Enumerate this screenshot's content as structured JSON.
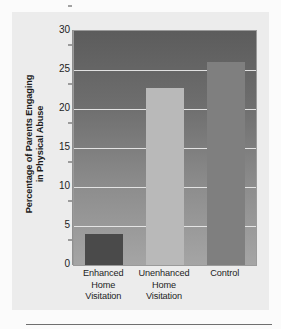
{
  "chart_data": {
    "type": "bar",
    "title": "",
    "subtitle": "",
    "xlabel": "",
    "ylabel": "Percentage of Parents Engaging in Physical Abuse",
    "ylabel_lines": [
      "Percentage of Parents Engaging",
      "in Physical Abuse"
    ],
    "categories": [
      "Enhanced Home Visitation",
      "Unenhanced Home Visitation",
      "Control"
    ],
    "category_lines": [
      [
        "Enhanced",
        "Home",
        "Visitation"
      ],
      [
        "Unenhanced",
        "Home",
        "Visitation"
      ],
      [
        "Control"
      ]
    ],
    "values": [
      4,
      22.7,
      26
    ],
    "ylim": [
      0,
      30
    ],
    "yticks": [
      0,
      5,
      10,
      15,
      20,
      25,
      30
    ],
    "ytick_labels": [
      "0",
      "5",
      "10",
      "15",
      "20",
      "25",
      "30"
    ],
    "grid": true,
    "grid_axis": "y",
    "legend": "none",
    "bar_colors": [
      "#4a4a4a",
      "#b9b9b9",
      "#7f7f7f"
    ],
    "plot_bg_top": "#5c5c5c",
    "plot_bg_bottom": "#a5a5a5",
    "panel_bg": "#ececec",
    "gridline_color": "#e8e8e8",
    "text_color": "#1d1d1d"
  }
}
